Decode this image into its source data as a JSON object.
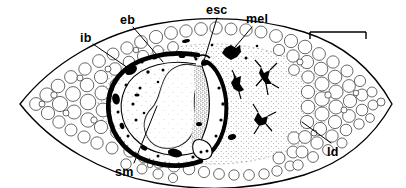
{
  "figure": {
    "caption": "",
    "background_color": "#ffffff",
    "ink_color": "#000000"
  },
  "labels": [
    {
      "id": "ib",
      "text": "ib",
      "meaning": "inner-band",
      "x": 80,
      "y": 32,
      "leader_to_x": 131,
      "leader_to_y": 70
    },
    {
      "id": "eb",
      "text": "eb",
      "meaning": "external-band",
      "x": 120,
      "y": 14,
      "leader_to_x": 163,
      "leader_to_y": 62
    },
    {
      "id": "esc",
      "text": "esc",
      "meaning": "encapsulated-sac",
      "x": 206,
      "y": 4,
      "leader_to_x": 203,
      "leader_to_y": 64
    },
    {
      "id": "mel",
      "text": "mel",
      "meaning": "melanized-nodule",
      "x": 246,
      "y": 13,
      "leader_to_x": 229,
      "leader_to_y": 55
    },
    {
      "id": "sm",
      "text": "sm",
      "meaning": "smooth-muscle",
      "x": 115,
      "y": 166,
      "leader_to_x": 157,
      "leader_to_y": 106
    },
    {
      "id": "ld",
      "text": "ld",
      "meaning": "lipid-droplets",
      "x": 327,
      "y": 146,
      "leader_to_x": 302,
      "leader_to_y": 122
    }
  ],
  "scale_bar": {
    "text": "",
    "x": 310,
    "y": 32,
    "length_px": 56,
    "cap_height_px": 7
  },
  "anatomy": {
    "body_outline": "lens-shaped-section",
    "left_tip_x": 20,
    "right_tip_x": 392,
    "vertical_center_y": 104,
    "inner_capsule": "c-shaped-dark-band",
    "central_mass": "stippled-kidney-shaped-core",
    "cell_fill": "polygonal-vacuolated-cells"
  }
}
